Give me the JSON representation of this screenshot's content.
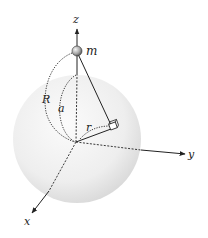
{
  "diagram": {
    "labels": {
      "z_axis": "z",
      "y_axis": "y",
      "x_axis": "x",
      "mass": "m",
      "distance_R": "R",
      "distance_a": "a",
      "distance_r": "r"
    },
    "colors": {
      "sphere_center": "#f7f7f7",
      "sphere_edge": "#d6d6d6",
      "lines": "#222222",
      "mass_fill": "#9a9a9a"
    }
  }
}
